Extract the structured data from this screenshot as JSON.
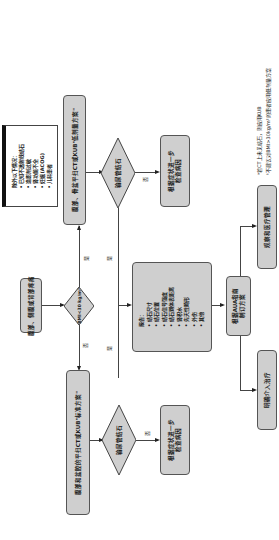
{
  "flowchart": {
    "start": "腹部、侧腹或背部疼痛",
    "bmi_decision": "BMI<30 kg/m²",
    "yes": "是",
    "no": "否",
    "low_dose_box": "腹部、骨盆平扫CT或KUB\"低剂量方案\"",
    "standard_box": "腹部和盆腔的平扫CT或KUB\"标准方案\"",
    "exclusions": {
      "title": "除外以下情况：",
      "items": [
        "已知不透射线结石",
        "造影剂过敏",
        "肾功能不全",
        "妊娠(ACOG)",
        "儿科患者"
      ]
    },
    "stone_decision_top": "输尿管结石",
    "stone_decision_bottom": "输尿管结石",
    "further_eval_top": [
      "根据症状进一步",
      "检查病因"
    ],
    "further_eval_bottom": [
      "根据症状进一步",
      "检查病因"
    ],
    "report": {
      "title": "报告：",
      "items": [
        "结石尺寸",
        "结石位置",
        "结石信号强度",
        "结石到体表距离",
        "肾积水",
        "先天性畸形",
        "外伤",
        "其他"
      ]
    },
    "aua_box": [
      "根据AUA指南",
      "制订方案"
    ],
    "observation_box": "观察和医疗管理",
    "intervention_box": "明确介入治疗",
    "footnotes": [
      "ᵃ若CT上未见结石，则应用KUB",
      "ᵇ不建议对BMI>30kg/m²的患者应用低剂量方案"
    ]
  }
}
